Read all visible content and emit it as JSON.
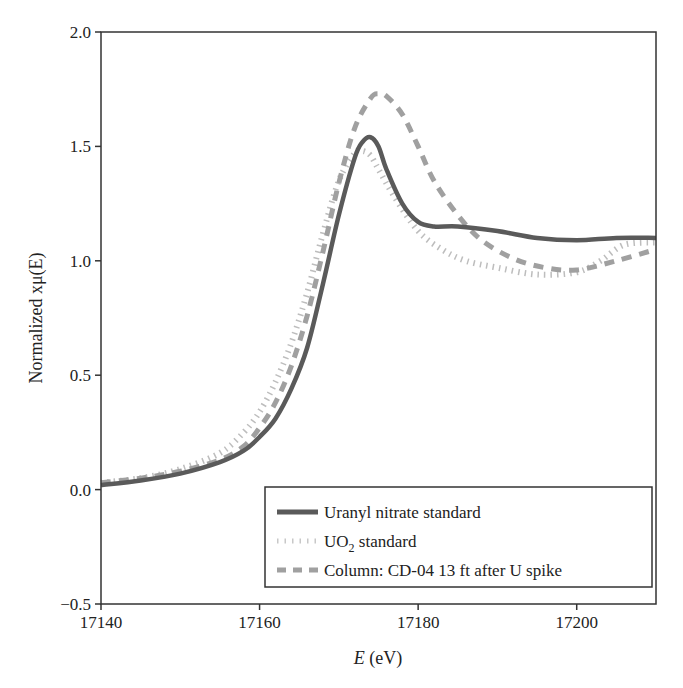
{
  "chart_data": {
    "type": "line",
    "title": "",
    "xlabel": "E (eV)",
    "xlabel_italic_part": "E",
    "xlabel_unit": "(eV)",
    "ylabel": "Normalized xμ(E)",
    "xlim": [
      17140,
      17210
    ],
    "ylim": [
      -0.5,
      2.0
    ],
    "xticks": [
      17140,
      17160,
      17180,
      17200
    ],
    "xtick_labels": [
      "17140",
      "17160",
      "17180",
      "17200"
    ],
    "yticks": [
      -0.5,
      0.0,
      0.5,
      1.0,
      1.5,
      2.0
    ],
    "ytick_labels": [
      "−0.5",
      "0.0",
      "0.5",
      "1.0",
      "1.5",
      "2.0"
    ],
    "grid": false,
    "legend_position": "lower right",
    "series": [
      {
        "name": "Uranyl nitrate standard",
        "style": "solid",
        "color": "#5a5a5a",
        "x": [
          17140,
          17145,
          17150,
          17155,
          17158,
          17160,
          17162,
          17164,
          17166,
          17168,
          17170,
          17172,
          17173,
          17174,
          17175,
          17176,
          17178,
          17180,
          17182,
          17185,
          17190,
          17195,
          17200,
          17205,
          17210
        ],
        "y": [
          0.02,
          0.04,
          0.07,
          0.12,
          0.17,
          0.23,
          0.31,
          0.44,
          0.62,
          0.9,
          1.2,
          1.45,
          1.52,
          1.54,
          1.5,
          1.4,
          1.25,
          1.17,
          1.15,
          1.15,
          1.13,
          1.1,
          1.09,
          1.1,
          1.1
        ]
      },
      {
        "name": "UO2 standard",
        "name_base": "UO",
        "name_sub": "2",
        "name_rest": " standard",
        "style": "dotted",
        "color": "#bdbdbd",
        "x": [
          17140,
          17145,
          17150,
          17155,
          17158,
          17160,
          17162,
          17164,
          17166,
          17168,
          17170,
          17172,
          17173,
          17174,
          17175,
          17177,
          17180,
          17183,
          17186,
          17190,
          17195,
          17200,
          17203,
          17206,
          17210
        ],
        "y": [
          0.03,
          0.05,
          0.09,
          0.16,
          0.25,
          0.34,
          0.47,
          0.64,
          0.86,
          1.12,
          1.35,
          1.47,
          1.48,
          1.46,
          1.4,
          1.28,
          1.13,
          1.05,
          1.0,
          0.97,
          0.94,
          0.95,
          1.0,
          1.07,
          1.08
        ]
      },
      {
        "name": "Column: CD-04 13 ft after U spike",
        "style": "dashed",
        "color": "#a0a0a0",
        "x": [
          17140,
          17145,
          17150,
          17155,
          17158,
          17160,
          17162,
          17164,
          17166,
          17168,
          17170,
          17172,
          17174,
          17175,
          17176,
          17178,
          17180,
          17182,
          17185,
          17188,
          17192,
          17196,
          17200,
          17205,
          17210
        ],
        "y": [
          0.03,
          0.05,
          0.08,
          0.13,
          0.19,
          0.27,
          0.38,
          0.54,
          0.76,
          1.04,
          1.34,
          1.58,
          1.71,
          1.73,
          1.72,
          1.64,
          1.5,
          1.35,
          1.2,
          1.09,
          1.01,
          0.97,
          0.96,
          1.0,
          1.05
        ]
      }
    ]
  }
}
